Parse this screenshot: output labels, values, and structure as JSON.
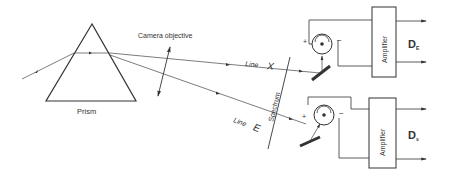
{
  "diagram": {
    "prism_label": "Prism",
    "lens_label": "Camera objective",
    "line_x_label": "Line",
    "line_x_letter": "X",
    "line_e_label": "Line",
    "line_e_letter": "E",
    "spectrum_label": "Spectrum",
    "amplifier_top_label": "Amplifier",
    "amplifier_bottom_label": "Amplifier",
    "output_top": {
      "main": "D",
      "sub": "E"
    },
    "output_bottom": {
      "main": "D",
      "sub": "s"
    },
    "plus_sign": "+",
    "minus_sign": "−"
  }
}
